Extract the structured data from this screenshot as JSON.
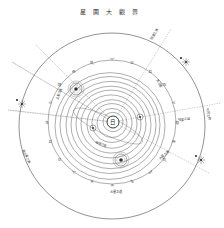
{
  "title": "星圖大觀界",
  "diagram": {
    "type": "heliocentric solar system chart",
    "center_symbol": "日",
    "colors": {
      "ink": "#4a4a4a",
      "paper": "#ffffff"
    },
    "outer_circle": {
      "cx": 112,
      "cy": 126,
      "r": 93
    },
    "zodiac_ring": {
      "cx": 112,
      "cy": 122,
      "r": 64
    },
    "orbits": [
      {
        "r": 10,
        "dx": 0,
        "dy": 0
      },
      {
        "r": 15,
        "dx": -1,
        "dy": 1
      },
      {
        "r": 20,
        "dx": -1,
        "dy": 1
      },
      {
        "r": 25,
        "dx": -1,
        "dy": 2
      },
      {
        "r": 30,
        "dx": -2,
        "dy": 2
      },
      {
        "r": 35,
        "dx": -2,
        "dy": 2
      },
      {
        "r": 40,
        "dx": -2,
        "dy": 3
      },
      {
        "r": 45,
        "dx": -2,
        "dy": 3
      },
      {
        "r": 50,
        "dx": -3,
        "dy": 3
      },
      {
        "r": 55,
        "dx": -3,
        "dy": 4
      }
    ],
    "planets": [
      {
        "name": "planet-ringed-upper-left",
        "cx": 76,
        "cy": 89,
        "r": 6
      },
      {
        "name": "planet-ringed-lower",
        "cx": 121,
        "cy": 160,
        "r": 6
      },
      {
        "name": "planet-small-right",
        "cx": 140,
        "cy": 117,
        "r": 3
      },
      {
        "name": "planet-small-left",
        "cx": 93,
        "cy": 128,
        "r": 3
      }
    ],
    "stars": [
      {
        "name": "star-upper-right",
        "cx": 186,
        "cy": 62
      },
      {
        "name": "star-left",
        "cx": 22,
        "cy": 104
      },
      {
        "name": "star-right",
        "cx": 201,
        "cy": 160
      }
    ],
    "labels": [
      {
        "text": "恒星之界",
        "x": 152,
        "y": 40,
        "rot": -60
      },
      {
        "text": "天王星",
        "x": 156,
        "y": 80,
        "rot": 60
      },
      {
        "text": "土星之道",
        "x": 58,
        "y": 100,
        "rot": -70
      },
      {
        "text": "木星之道",
        "x": 160,
        "y": 160,
        "rot": -40
      },
      {
        "text": "海王星之界",
        "x": 22,
        "y": 150,
        "rot": 65
      },
      {
        "text": "彗星之道",
        "x": 178,
        "y": 121,
        "rot": -5
      },
      {
        "text": "地球之道",
        "x": 95,
        "y": 143,
        "rot": 20
      },
      {
        "text": "火星之道",
        "x": 110,
        "y": 193,
        "rot": 0
      },
      {
        "text": "天河之界",
        "x": 206,
        "y": 108,
        "rot": 80
      }
    ]
  }
}
